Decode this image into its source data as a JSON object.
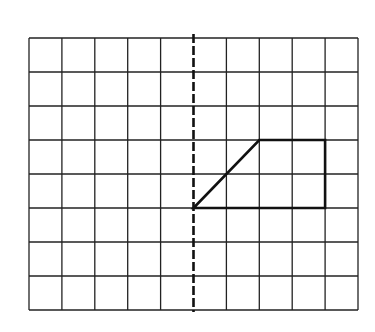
{
  "diagram": {
    "type": "grid-reflection",
    "grid": {
      "columns": 10,
      "rows": 8,
      "origin_px": [
        29,
        38
      ],
      "cell_w": 32.9,
      "cell_h": 34,
      "line_color": "#222222"
    },
    "mirror_line": {
      "orientation": "vertical",
      "column": 5,
      "style": "dashed",
      "color": "#111111"
    },
    "shape": {
      "name": "trapezium",
      "vertices": [
        [
          5,
          5
        ],
        [
          7,
          3
        ],
        [
          9,
          3
        ],
        [
          9,
          5
        ]
      ],
      "color": "#111111"
    }
  }
}
